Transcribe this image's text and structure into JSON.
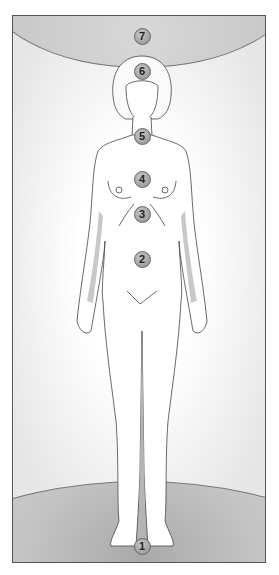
{
  "figure": {
    "colors": {
      "frame_border": "#555555",
      "marker_fill": "#a8a8a8",
      "shading": "#c4c4c4",
      "outline": "#444444"
    },
    "markers": [
      {
        "label": "1",
        "x": 141,
        "y": 545,
        "location": "between feet"
      },
      {
        "label": "2",
        "x": 141,
        "y": 258,
        "location": "lower abdomen"
      },
      {
        "label": "3",
        "x": 141,
        "y": 213,
        "location": "upper abdomen"
      },
      {
        "label": "4",
        "x": 141,
        "y": 178,
        "location": "chest"
      },
      {
        "label": "5",
        "x": 141,
        "y": 135,
        "location": "throat"
      },
      {
        "label": "6",
        "x": 141,
        "y": 70,
        "location": "forehead"
      },
      {
        "label": "7",
        "x": 141,
        "y": 35,
        "location": "above head"
      }
    ]
  }
}
